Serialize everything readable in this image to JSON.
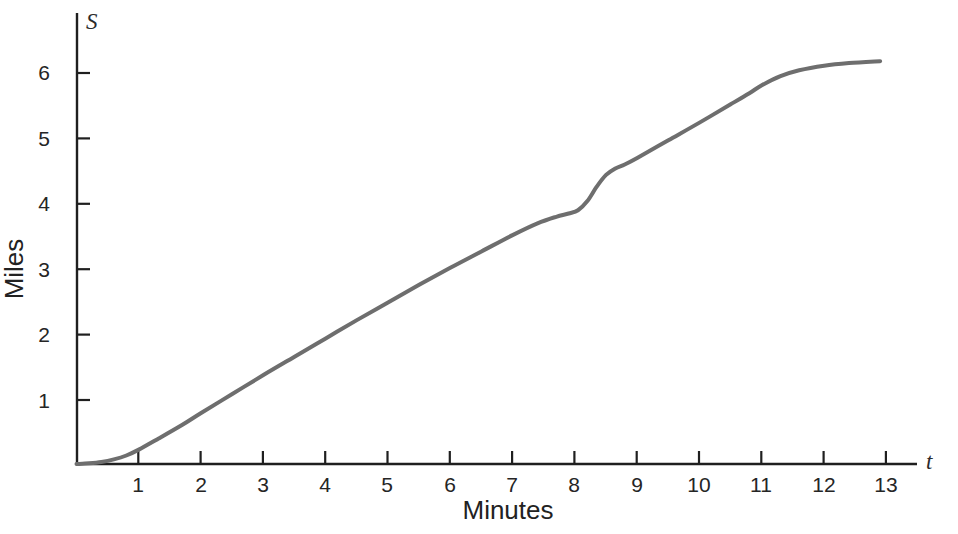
{
  "chart_data": {
    "type": "line",
    "title": "",
    "subtitle": "",
    "xlabel": "Minutes",
    "ylabel": "Miles",
    "x_axis_variable": "t",
    "y_axis_variable": "S",
    "xlim": [
      0,
      13.8
    ],
    "ylim": [
      0,
      6.6
    ],
    "xticks": [
      1,
      2,
      3,
      4,
      5,
      6,
      7,
      8,
      9,
      10,
      11,
      12,
      13
    ],
    "xtick_labels": [
      "1",
      "2",
      "3",
      "4",
      "5",
      "6",
      "7",
      "8",
      "9",
      "10",
      "11",
      "12",
      "13"
    ],
    "yticks": [
      1,
      2,
      3,
      4,
      5,
      6
    ],
    "ytick_labels": [
      "1",
      "2",
      "3",
      "4",
      "5",
      "6"
    ],
    "grid": false,
    "legend": "none",
    "annotations": [],
    "series": [
      {
        "name": "Distance traveled",
        "color": "#6e6e6e",
        "line_width": 4,
        "x": [
          0.0,
          0.2,
          0.4,
          0.6,
          0.8,
          1.0,
          1.3,
          1.7,
          2.0,
          2.5,
          3.0,
          3.5,
          4.0,
          4.5,
          5.0,
          5.5,
          6.0,
          6.5,
          7.0,
          7.4,
          7.7,
          7.9,
          8.05,
          8.2,
          8.35,
          8.5,
          8.65,
          8.8,
          9.0,
          9.5,
          10.0,
          10.5,
          10.8,
          11.0,
          11.3,
          11.6,
          12.0,
          12.4,
          12.9
        ],
        "y": [
          0.0,
          0.01,
          0.03,
          0.07,
          0.13,
          0.22,
          0.38,
          0.6,
          0.78,
          1.07,
          1.36,
          1.64,
          1.92,
          2.2,
          2.47,
          2.74,
          3.0,
          3.25,
          3.5,
          3.68,
          3.78,
          3.83,
          3.88,
          4.02,
          4.24,
          4.42,
          4.52,
          4.58,
          4.68,
          4.95,
          5.22,
          5.5,
          5.67,
          5.79,
          5.93,
          6.02,
          6.09,
          6.13,
          6.16
        ]
      }
    ]
  },
  "axes": {
    "y_axis_variable_label": "S",
    "x_axis_variable_label": "t",
    "y_title": "Miles",
    "x_title": "Minutes"
  },
  "colors": {
    "curve": "#6e6e6e",
    "axis": "#1f1f1f",
    "tick_text": "#252525",
    "background": "#ffffff"
  }
}
